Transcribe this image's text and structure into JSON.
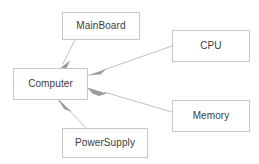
{
  "diagram": {
    "type": "uml-class-aggregation",
    "title": "",
    "canvas": {
      "width": 259,
      "height": 164,
      "background": "#ffffff"
    },
    "style": {
      "node_fill": "#ffffff",
      "node_border": "#c9c9c9",
      "label_color": "#3c3c3c",
      "edge_color": "#b4b4b4",
      "arrowhead_color": "#9a9a9a"
    },
    "nodes": [
      {
        "id": "mainboard",
        "label": "MainBoard"
      },
      {
        "id": "computer",
        "label": "Computer"
      },
      {
        "id": "cpu",
        "label": "CPU"
      },
      {
        "id": "memory",
        "label": "Memory"
      },
      {
        "id": "powersupply",
        "label": "PowerSupply"
      }
    ],
    "edges": [
      {
        "id": "edge-mainboard-computer",
        "from": "mainboard",
        "to": "computer",
        "kind": "aggregation",
        "label": ""
      },
      {
        "id": "edge-cpu-computer",
        "from": "cpu",
        "to": "computer",
        "kind": "aggregation",
        "label": ""
      },
      {
        "id": "edge-memory-computer",
        "from": "memory",
        "to": "computer",
        "kind": "aggregation",
        "label": ""
      },
      {
        "id": "edge-powersupply-computer",
        "from": "powersupply",
        "to": "computer",
        "kind": "aggregation",
        "label": ""
      }
    ]
  }
}
